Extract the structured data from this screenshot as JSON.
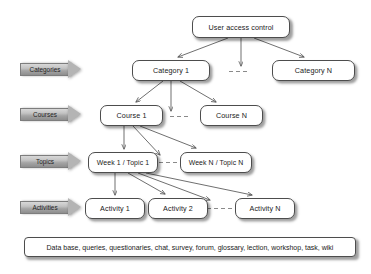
{
  "diagram": {
    "background_color": "#ffffff",
    "node_border_color": "#4d4d4d",
    "band_color": "#b4b4b4",
    "edge_color": "#555555"
  },
  "root": {
    "label": "User access control"
  },
  "bands": [
    {
      "label": "Categories"
    },
    {
      "label": "Courses"
    },
    {
      "label": "Topics"
    },
    {
      "label": "Activities"
    }
  ],
  "levels": {
    "categories": [
      {
        "label": "Category 1"
      },
      {
        "label": "Category N"
      }
    ],
    "courses": [
      {
        "label": "Course 1"
      },
      {
        "label": "Course N"
      }
    ],
    "topics": [
      {
        "label": "Week 1 / Topic 1"
      },
      {
        "label": "Week N / Topic N"
      }
    ],
    "activities": [
      {
        "label": "Activity 1"
      },
      {
        "label": "Activity 2"
      },
      {
        "label": "Activity N"
      }
    ]
  },
  "legend": {
    "label": "Data base, queries, questionaries, chat, survey, forum, glossary, lection, workshop, task, wiki"
  }
}
